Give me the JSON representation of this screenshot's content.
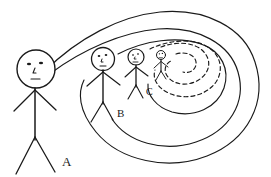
{
  "diagram": {
    "background_color": "#ffffff",
    "ink_color": "#1a1a1a",
    "figures": [
      {
        "id": "A",
        "label": "A",
        "size": "largest",
        "head_center_x": 36,
        "head_center_y": 69,
        "head_radius": 19,
        "body_bottom_y": 140,
        "label_x": 62,
        "label_y": 166,
        "label_font_size": 13,
        "face": "two-eyes-nose-mouth"
      },
      {
        "id": "B",
        "label": "B",
        "size": "large",
        "head_center_x": 103,
        "head_center_y": 59,
        "head_radius": 11.5,
        "body_bottom_y": 104,
        "label_x": 117,
        "label_y": 117,
        "label_font_size": 11,
        "face": "two-eyes-nose-mouth"
      },
      {
        "id": "C",
        "label": "C",
        "size": "medium",
        "head_center_x": 136,
        "head_center_y": 57,
        "head_radius": 8,
        "body_bottom_y": 87,
        "label_x": 146,
        "label_y": 95,
        "label_font_size": 10,
        "face": "two-eyes-nose-mouth"
      },
      {
        "id": "D",
        "label": "",
        "size": "smallest",
        "head_center_x": 161,
        "head_center_y": 55,
        "head_radius": 4.5,
        "body_bottom_y": 72,
        "label_x": 0,
        "label_y": 0,
        "label_font_size": 0,
        "face": "two-eyes-nose-mouth"
      }
    ],
    "spirals": [
      {
        "name": "outer-solid-spiral",
        "style": "solid",
        "turns": 2,
        "description": "solid spiral starting at figure A head, winding clockwise inward toward the center at the right"
      },
      {
        "name": "inner-dashed-spiral",
        "style": "dashed",
        "turns": 2,
        "description": "dashed spiral continuing inward from near the smallest figure toward the spiral center"
      }
    ],
    "labels": [
      {
        "text": "A"
      },
      {
        "text": "B"
      },
      {
        "text": "C"
      }
    ]
  }
}
